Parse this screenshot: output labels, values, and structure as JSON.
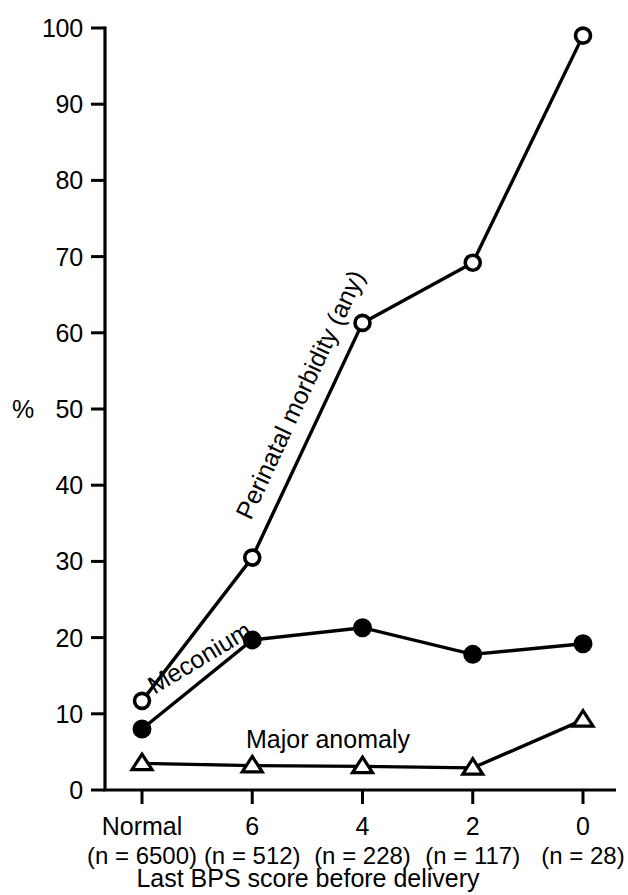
{
  "chart_data": {
    "type": "line",
    "title": "",
    "xlabel": "Last BPS score before delivery",
    "ylabel": "%",
    "ylim": [
      0,
      100
    ],
    "grid": false,
    "legend_position": "inline-on-lines",
    "categories": [
      "Normal",
      "6",
      "4",
      "2",
      "0"
    ],
    "category_counts": [
      "(n = 6500)",
      "(n = 512)",
      "(n = 228)",
      "(n = 117)",
      "(n = 28)"
    ],
    "ytick_labels": [
      "100",
      "90",
      "80",
      "70",
      "60",
      "50",
      "40",
      "30",
      "20",
      "10",
      "0"
    ],
    "ytick_values": [
      100,
      90,
      80,
      70,
      60,
      50,
      40,
      30,
      20,
      10,
      0
    ],
    "series": [
      {
        "name": "Perinatal morbidity (any)",
        "marker": "open-circle",
        "values": [
          11.7,
          30.5,
          61.3,
          69.2,
          99.0
        ]
      },
      {
        "name": "Meconium",
        "marker": "filled-circle",
        "values": [
          8.0,
          19.7,
          21.3,
          17.8,
          19.2
        ]
      },
      {
        "name": "Major anomaly",
        "marker": "open-triangle",
        "values": [
          3.5,
          3.2,
          3.1,
          2.9,
          9.2
        ]
      }
    ]
  },
  "colors": {
    "ink": "#000000",
    "background": "#ffffff"
  }
}
